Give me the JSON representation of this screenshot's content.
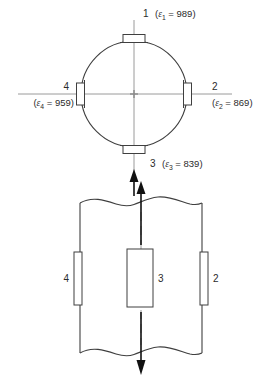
{
  "figure": {
    "units_note": "microstrain",
    "colors": {
      "outline": "#3f3f3f",
      "centerline": "#9a9a9a",
      "arrow": "#111111",
      "gauge_fill": "#ffffff",
      "text": "#2b2b2b",
      "background": "#ffffff"
    }
  },
  "top_view": {
    "name": "cross-section-circle-view",
    "gauges": [
      {
        "id": "1",
        "position": "top",
        "number_label": "1",
        "strain_label": "(ε1 = 989)",
        "epsilon": "ε",
        "subscript": "1",
        "equals": " = ",
        "value": "989",
        "open_paren": "(",
        "close_paren": ")"
      },
      {
        "id": "2",
        "position": "right",
        "number_label": "2",
        "strain_label": "(ε2 = 869)",
        "epsilon": "ε",
        "subscript": "2",
        "equals": " = ",
        "value": "869",
        "open_paren": "(",
        "close_paren": ")"
      },
      {
        "id": "3",
        "position": "bottom",
        "number_label": "3",
        "strain_label": "(ε3 = 839)",
        "epsilon": "ε",
        "subscript": "3",
        "equals": " = ",
        "value": "839",
        "open_paren": "(",
        "close_paren": ")"
      },
      {
        "id": "4",
        "position": "left",
        "number_label": "4",
        "strain_label": "(ε4 = 959)",
        "epsilon": "ε",
        "subscript": "4",
        "equals": " = ",
        "value": "959",
        "open_paren": "(",
        "close_paren": ")"
      }
    ]
  },
  "bottom_view": {
    "name": "side-elevation-view",
    "gauges": [
      {
        "id": "4",
        "position": "left",
        "number_label": "4"
      },
      {
        "id": "3",
        "position": "center",
        "number_label": "3"
      },
      {
        "id": "2",
        "position": "right",
        "number_label": "2"
      }
    ],
    "break_lines": "wavy",
    "axis_arrows": [
      "up",
      "down"
    ]
  }
}
